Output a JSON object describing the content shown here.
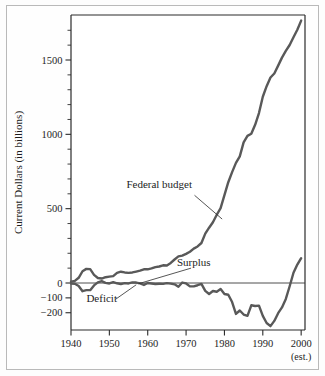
{
  "figure": {
    "background_color": "#fdfdfd",
    "frame_color": "#b9b9b9",
    "line_color": "#595959",
    "axis_color": "#2b2b2b"
  },
  "chart_data": {
    "type": "line",
    "title": "",
    "xlabel": "",
    "ylabel": "Current Dollars (in billions)",
    "xlim": [
      1940,
      2001
    ],
    "ylim": [
      -260,
      1800
    ],
    "grid": false,
    "legend_position": "inline-annotations",
    "x_ticks": [
      1940,
      1950,
      1960,
      1970,
      1980,
      1990,
      2000
    ],
    "x_tick_labels": [
      "1940",
      "1950",
      "1960",
      "1970",
      "1980",
      "1990",
      "2000"
    ],
    "x_note": "(est.)",
    "y_ticks": [
      1500,
      1000,
      500,
      0,
      -100,
      -200
    ],
    "y_tick_labels": [
      "1500",
      "1000",
      "500",
      "0",
      "-100",
      "-200"
    ],
    "y_minor_ticks": [
      1700,
      1600,
      1400,
      1300,
      1200,
      1100,
      900,
      800,
      700,
      600,
      400,
      300,
      200,
      100
    ],
    "annotations": [
      {
        "text": "Federal budget",
        "x": 1963,
        "y": 640
      },
      {
        "text": "Surplus",
        "x": 1972,
        "y": 115
      },
      {
        "text": "Deficit",
        "x": 1948,
        "y": -125
      }
    ],
    "series": [
      {
        "name": "Federal budget",
        "points": [
          [
            1940,
            9
          ],
          [
            1941,
            14
          ],
          [
            1942,
            35
          ],
          [
            1943,
            79
          ],
          [
            1944,
            95
          ],
          [
            1945,
            93
          ],
          [
            1946,
            55
          ],
          [
            1947,
            34
          ],
          [
            1948,
            30
          ],
          [
            1949,
            39
          ],
          [
            1950,
            43
          ],
          [
            1951,
            46
          ],
          [
            1952,
            68
          ],
          [
            1953,
            76
          ],
          [
            1954,
            71
          ],
          [
            1955,
            68
          ],
          [
            1956,
            71
          ],
          [
            1957,
            77
          ],
          [
            1958,
            83
          ],
          [
            1959,
            92
          ],
          [
            1960,
            92
          ],
          [
            1961,
            98
          ],
          [
            1962,
            107
          ],
          [
            1963,
            111
          ],
          [
            1964,
            119
          ],
          [
            1965,
            118
          ],
          [
            1966,
            135
          ],
          [
            1967,
            158
          ],
          [
            1968,
            179
          ],
          [
            1969,
            184
          ],
          [
            1970,
            196
          ],
          [
            1971,
            210
          ],
          [
            1972,
            231
          ],
          [
            1973,
            246
          ],
          [
            1974,
            269
          ],
          [
            1975,
            332
          ],
          [
            1976,
            372
          ],
          [
            1977,
            409
          ],
          [
            1978,
            459
          ],
          [
            1979,
            504
          ],
          [
            1980,
            591
          ],
          [
            1981,
            678
          ],
          [
            1982,
            746
          ],
          [
            1983,
            808
          ],
          [
            1984,
            852
          ],
          [
            1985,
            946
          ],
          [
            1986,
            990
          ],
          [
            1987,
            1004
          ],
          [
            1988,
            1064
          ],
          [
            1989,
            1143
          ],
          [
            1990,
            1253
          ],
          [
            1991,
            1324
          ],
          [
            1992,
            1382
          ],
          [
            1993,
            1409
          ],
          [
            1994,
            1462
          ],
          [
            1995,
            1516
          ],
          [
            1996,
            1561
          ],
          [
            1997,
            1601
          ],
          [
            1998,
            1653
          ],
          [
            1999,
            1703
          ],
          [
            2000,
            1765
          ]
        ]
      },
      {
        "name": "Surplus / Deficit",
        "points": [
          [
            1940,
            -3
          ],
          [
            1941,
            -5
          ],
          [
            1942,
            -20
          ],
          [
            1943,
            -55
          ],
          [
            1944,
            -48
          ],
          [
            1945,
            -48
          ],
          [
            1946,
            -16
          ],
          [
            1947,
            4
          ],
          [
            1948,
            12
          ],
          [
            1949,
            1
          ],
          [
            1950,
            -3
          ],
          [
            1951,
            6
          ],
          [
            1952,
            -2
          ],
          [
            1953,
            -7
          ],
          [
            1954,
            -1
          ],
          [
            1955,
            -3
          ],
          [
            1956,
            4
          ],
          [
            1957,
            3
          ],
          [
            1958,
            -3
          ],
          [
            1959,
            -13
          ],
          [
            1960,
            0
          ],
          [
            1961,
            -3
          ],
          [
            1962,
            -7
          ],
          [
            1963,
            -5
          ],
          [
            1964,
            -6
          ],
          [
            1965,
            -1
          ],
          [
            1966,
            -4
          ],
          [
            1967,
            -9
          ],
          [
            1968,
            -25
          ],
          [
            1969,
            3
          ],
          [
            1970,
            -3
          ],
          [
            1971,
            -23
          ],
          [
            1972,
            -23
          ],
          [
            1973,
            -15
          ],
          [
            1974,
            -6
          ],
          [
            1975,
            -53
          ],
          [
            1976,
            -74
          ],
          [
            1977,
            -54
          ],
          [
            1978,
            -59
          ],
          [
            1979,
            -41
          ],
          [
            1980,
            -74
          ],
          [
            1981,
            -79
          ],
          [
            1982,
            -128
          ],
          [
            1983,
            -208
          ],
          [
            1984,
            -185
          ],
          [
            1985,
            -212
          ],
          [
            1986,
            -221
          ],
          [
            1987,
            -150
          ],
          [
            1988,
            -155
          ],
          [
            1989,
            -152
          ],
          [
            1990,
            -221
          ],
          [
            1991,
            -269
          ],
          [
            1992,
            -290
          ],
          [
            1993,
            -255
          ],
          [
            1994,
            -203
          ],
          [
            1995,
            -164
          ],
          [
            1996,
            -107
          ],
          [
            1997,
            -22
          ],
          [
            1998,
            69
          ],
          [
            1999,
            124
          ],
          [
            2000,
            167
          ]
        ]
      }
    ]
  }
}
